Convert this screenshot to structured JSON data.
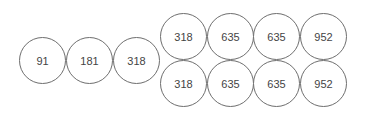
{
  "left_group": {
    "values": [
      "91",
      "181",
      "318"
    ]
  },
  "right_grid": {
    "rows": [
      [
        "318",
        "635",
        "635",
        "952"
      ],
      [
        "318",
        "635",
        "635",
        "952"
      ]
    ]
  },
  "colors": {
    "stroke": "#6e6e6e",
    "text": "#444444",
    "background": "#ffffff"
  }
}
